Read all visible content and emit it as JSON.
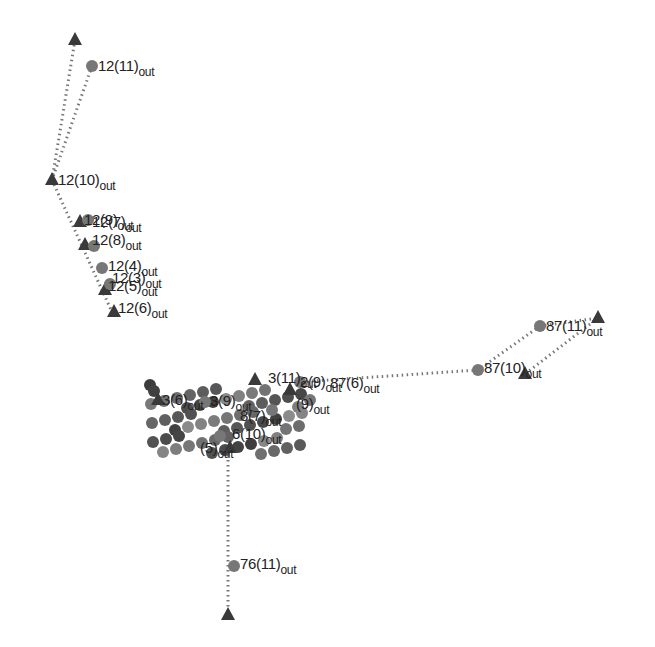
{
  "diagram": {
    "title": "",
    "colors": {
      "triangle": "#3a3a3a",
      "circle": "#777777",
      "edge": "#777777",
      "cluster": "#555555"
    },
    "edges": [
      {
        "from": [
          75,
          40
        ],
        "to": [
          52,
          180
        ]
      },
      {
        "from": [
          92,
          66
        ],
        "to": [
          52,
          180
        ]
      },
      {
        "from": [
          52,
          180
        ],
        "to": [
          112,
          312
        ]
      },
      {
        "from": [
          540,
          326
        ],
        "to": [
          598,
          318
        ]
      },
      {
        "from": [
          598,
          318
        ],
        "to": [
          525,
          374
        ]
      },
      {
        "from": [
          540,
          326
        ],
        "to": [
          478,
          370
        ]
      },
      {
        "from": [
          478,
          370
        ],
        "to": [
          300,
          382
        ]
      },
      {
        "from": [
          228,
          440
        ],
        "to": [
          228,
          615
        ]
      }
    ],
    "nodes": [
      {
        "shape": "triangle",
        "x": 75,
        "y": 40
      },
      {
        "shape": "circle",
        "x": 92,
        "y": 66,
        "label": "12(11)",
        "sub": "out",
        "lx": 98,
        "ly": 58
      },
      {
        "shape": "triangle",
        "x": 52,
        "y": 180,
        "label": "12(10)",
        "sub": "out",
        "lx": 58,
        "ly": 172
      },
      {
        "shape": "triangle",
        "x": 80,
        "y": 222,
        "label": "12(9)",
        "sub": "out",
        "lx": 84,
        "ly": 212
      },
      {
        "shape": "circle",
        "x": 88,
        "y": 220,
        "label": "12(7)",
        "sub": "out",
        "lx": 92,
        "ly": 214
      },
      {
        "shape": "triangle",
        "x": 85,
        "y": 245,
        "label": "12(8)",
        "sub": "out",
        "lx": 92,
        "ly": 232
      },
      {
        "shape": "circle",
        "x": 94,
        "y": 246
      },
      {
        "shape": "circle",
        "x": 102,
        "y": 268,
        "label": "12(4)",
        "sub": "out",
        "lx": 108,
        "ly": 258
      },
      {
        "shape": "triangle",
        "x": 105,
        "y": 290,
        "label": "12(5)",
        "sub": "out",
        "lx": 108,
        "ly": 278
      },
      {
        "shape": "circle",
        "x": 110,
        "y": 284,
        "label": "12(3)",
        "sub": "out",
        "lx": 112,
        "ly": 270
      },
      {
        "shape": "triangle",
        "x": 114,
        "y": 312,
        "label": "12(6)",
        "sub": "out",
        "lx": 118,
        "ly": 300
      },
      {
        "shape": "circle",
        "x": 540,
        "y": 326,
        "label": "87(11)",
        "sub": "out",
        "lx": 546,
        "ly": 318
      },
      {
        "shape": "triangle",
        "x": 598,
        "y": 318
      },
      {
        "shape": "circle",
        "x": 478,
        "y": 370,
        "label": "87(10)",
        "sub": "out",
        "lx": 484,
        "ly": 360
      },
      {
        "shape": "triangle",
        "x": 525,
        "y": 374
      },
      {
        "shape": "triangle",
        "x": 255,
        "y": 380,
        "label": "3(11)",
        "sub": "out",
        "lx": 268,
        "ly": 370
      },
      {
        "shape": "circle",
        "x": 300,
        "y": 382,
        "label": "87(6)",
        "sub": "out",
        "lx": 330,
        "ly": 375
      },
      {
        "shape": "triangle",
        "x": 290,
        "y": 390,
        "label": "2(9)",
        "sub": "out",
        "lx": 300,
        "ly": 374
      },
      {
        "shape": "circle",
        "x": 310,
        "y": 400,
        "label": "(9)",
        "sub": "out",
        "lx": 296,
        "ly": 396
      },
      {
        "shape": "triangle",
        "x": 158,
        "y": 400,
        "label": "3(6)",
        "sub": "out",
        "lx": 162,
        "ly": 392
      },
      {
        "shape": "circle",
        "x": 205,
        "y": 402,
        "label": "3(9)",
        "sub": "out",
        "lx": 210,
        "ly": 393
      },
      {
        "shape": "circle",
        "x": 272,
        "y": 410,
        "label": "8(7)",
        "sub": "out",
        "lx": 240,
        "ly": 408
      },
      {
        "shape": "circle",
        "x": 220,
        "y": 436,
        "label": "6(10)",
        "sub": "out",
        "lx": 232,
        "ly": 426
      },
      {
        "shape": "triangle",
        "x": 230,
        "y": 448,
        "label": "(5)",
        "sub": "out",
        "lx": 200,
        "ly": 440
      },
      {
        "shape": "circle",
        "x": 234,
        "y": 566,
        "label": "76(11)",
        "sub": "out",
        "lx": 240,
        "ly": 556
      },
      {
        "shape": "triangle",
        "x": 228,
        "y": 615
      }
    ],
    "cluster": {
      "x": 150,
      "y": 385,
      "w": 160,
      "h": 70
    }
  }
}
